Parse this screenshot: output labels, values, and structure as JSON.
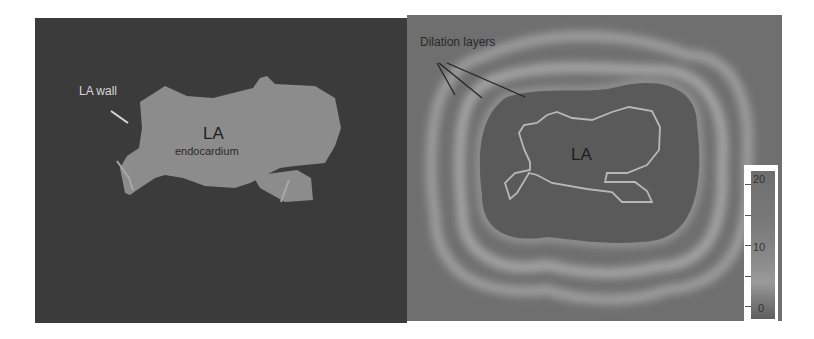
{
  "figure": {
    "left_panel": {
      "labels": {
        "wall": "LA wall",
        "la": "LA",
        "endocardium": "endocardium"
      },
      "colors": {
        "background": "#3b3b3b",
        "la_fill": "#8c8c8c",
        "wall_label": "#d8d8d8"
      }
    },
    "right_panel": {
      "labels": {
        "dilation": "Dilation layers",
        "la": "LA"
      },
      "colorbar": {
        "ticks": [
          "20",
          "10",
          "0"
        ],
        "min": 0,
        "max": 20
      },
      "colors": {
        "background": "#6f6f6f",
        "inner_region": "#5a5a5a",
        "ring": "#a5a5a5",
        "contour": "#b8b8b8"
      }
    }
  }
}
